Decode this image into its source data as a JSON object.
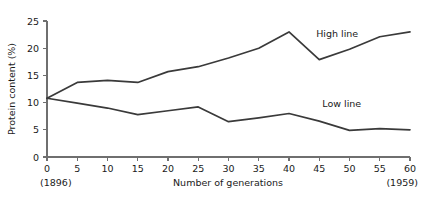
{
  "chart_data": {
    "type": "line",
    "title": "",
    "xlabel": "Number of generations",
    "ylabel": "Protein content (%)",
    "xlim": [
      0,
      60
    ],
    "ylim": [
      0,
      25
    ],
    "xticks": [
      0,
      5,
      10,
      15,
      20,
      25,
      30,
      35,
      40,
      45,
      50,
      55,
      60
    ],
    "yticks": [
      0,
      5,
      10,
      15,
      20,
      25
    ],
    "xtick_labels": [
      "0",
      "5",
      "10",
      "15",
      "20",
      "25",
      "30",
      "35",
      "40",
      "45",
      "50",
      "55",
      "60"
    ],
    "ytick_labels": [
      "0",
      "5",
      "10",
      "15",
      "20",
      "25"
    ],
    "grid": false,
    "legend_position": "inline-annotation",
    "x": [
      0,
      5,
      10,
      15,
      20,
      25,
      30,
      35,
      40,
      45,
      50,
      55,
      60
    ],
    "series": [
      {
        "name": "High line",
        "color": "#3a3a3a",
        "values": [
          10.8,
          13.7,
          14.1,
          13.7,
          15.7,
          16.6,
          18.2,
          20.0,
          23.0,
          17.9,
          19.8,
          22.1,
          23.0
        ]
      },
      {
        "name": "Low line",
        "color": "#3a3a3a",
        "values": [
          10.8,
          9.9,
          9.0,
          7.8,
          8.5,
          9.2,
          6.5,
          7.2,
          8.0,
          6.6,
          4.9,
          5.2,
          5.0
        ]
      }
    ],
    "annotations": [
      {
        "text": "High line",
        "x": 44.5,
        "y": 22.0
      },
      {
        "text": "Low line",
        "x": 45.5,
        "y": 9.1
      }
    ],
    "endpoint_years": {
      "start": "(1896)",
      "end": "(1959)"
    }
  }
}
